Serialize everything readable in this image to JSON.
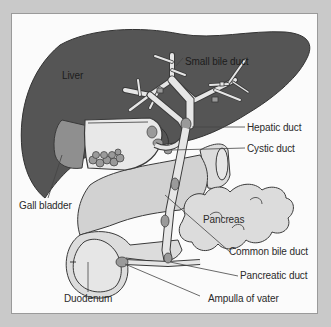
{
  "diagram": {
    "type": "anatomical-illustration",
    "colors": {
      "background": "#c9c9c9",
      "panel": "#fbfbfb",
      "liver": "#555555",
      "gall_bladder": "#8f8f8f",
      "duct": "#e6e6e6",
      "organ_light": "#dcdcdc",
      "stone": "#9a9a9a",
      "outline": "#3a3a3a",
      "leader_line": "#444444"
    },
    "labels": {
      "liver": "Liver",
      "small_bile_duct": "Small bile duct",
      "hepatic_duct": "Hepatic duct",
      "cystic_duct": "Cystic duct",
      "gall_bladder": "Gall bladder",
      "pancreas": "Pancreas",
      "common_bile_duct": "Common bile duct",
      "pancreatic_duct": "Pancreatic duct",
      "duodenum": "Duodenum",
      "ampulla_of_vater": "Ampulla of vater"
    }
  }
}
